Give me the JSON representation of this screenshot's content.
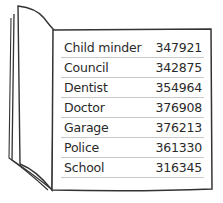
{
  "directory": {
    "entries": [
      {
        "name": "Child minder",
        "number": "347921"
      },
      {
        "name": "Council",
        "number": "342875"
      },
      {
        "name": "Dentist",
        "number": "354964"
      },
      {
        "name": "Doctor",
        "number": "376908"
      },
      {
        "name": "Garage",
        "number": "376213"
      },
      {
        "name": "Police",
        "number": "361330"
      },
      {
        "name": "School",
        "number": "316345"
      }
    ]
  }
}
